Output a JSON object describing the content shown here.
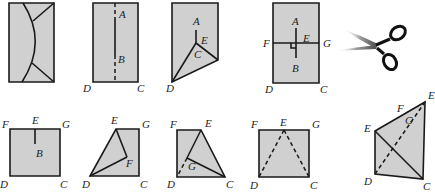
{
  "colors": {
    "paper": "#d0d0d0",
    "stroke": "#1a1a1a",
    "label": "#222222"
  },
  "panels": [
    {
      "id": "step1",
      "description": "Rectangle with curved cut and corner folds",
      "polygon": [
        [
          9,
          3
        ],
        [
          54,
          3
        ],
        [
          54,
          82
        ],
        [
          9,
          82
        ]
      ],
      "solid": [],
      "dashed": [],
      "curves": [
        "M23,3 Q48,42 22,82",
        "M54,3 L33,21",
        "M54,82 L32,63"
      ],
      "labels": []
    },
    {
      "id": "step2",
      "description": "Rectangle with vertical fold line AB",
      "polygon": [
        [
          93,
          3
        ],
        [
          138,
          3
        ],
        [
          138,
          82
        ],
        [
          93,
          82
        ]
      ],
      "solid": [
        [
          [
            115,
            17
          ],
          [
            115,
            55
          ]
        ]
      ],
      "dashed": [
        [
          [
            115,
            3
          ],
          [
            115,
            17
          ]
        ],
        [
          [
            115,
            55
          ],
          [
            115,
            82
          ]
        ]
      ],
      "curves": [],
      "labels": [
        {
          "t": "A",
          "x": 119,
          "y": 18
        },
        {
          "t": "B",
          "x": 118,
          "y": 63
        },
        {
          "t": "D",
          "x": 83,
          "y": 92
        },
        {
          "t": "C",
          "x": 137,
          "y": 92
        }
      ]
    },
    {
      "id": "step3",
      "description": "Folded shape with crease from C",
      "polygon": [
        [
          172,
          3
        ],
        [
          218,
          3
        ],
        [
          218,
          60
        ],
        [
          172,
          82
        ]
      ],
      "solid": [
        [
          [
            196,
            30
          ],
          [
            196,
            43
          ]
        ],
        [
          [
            196,
            43
          ],
          [
            172,
            82
          ]
        ],
        [
          [
            196,
            43
          ],
          [
            218,
            60
          ]
        ]
      ],
      "dashed": [],
      "curves": [],
      "labels": [
        {
          "t": "A",
          "x": 193,
          "y": 25
        },
        {
          "t": "E",
          "x": 201,
          "y": 44
        },
        {
          "t": "C",
          "x": 194,
          "y": 58
        },
        {
          "t": "D",
          "x": 166,
          "y": 92
        }
      ]
    },
    {
      "id": "step4",
      "description": "Rectangle with FG crease and AB perpendicular",
      "polygon": [
        [
          273,
          3
        ],
        [
          319,
          3
        ],
        [
          319,
          83
        ],
        [
          273,
          83
        ]
      ],
      "solid": [
        [
          [
            273,
            43
          ],
          [
            319,
            43
          ]
        ],
        [
          [
            296,
            28
          ],
          [
            296,
            58
          ]
        ]
      ],
      "dashed": [],
      "curves": [
        "M291,43 L291,48 L296,48"
      ],
      "labels": [
        {
          "t": "A",
          "x": 292,
          "y": 25
        },
        {
          "t": "F",
          "x": 263,
          "y": 47
        },
        {
          "t": "E",
          "x": 303,
          "y": 42
        },
        {
          "t": "G",
          "x": 323,
          "y": 47
        },
        {
          "t": "B",
          "x": 292,
          "y": 72
        },
        {
          "t": "D",
          "x": 265,
          "y": 93
        },
        {
          "t": "C",
          "x": 320,
          "y": 93
        }
      ]
    },
    {
      "id": "step5",
      "description": "Square FGCD with cut EB",
      "polygon": [
        [
          10,
          129
        ],
        [
          60,
          129
        ],
        [
          60,
          176
        ],
        [
          10,
          176
        ]
      ],
      "solid": [
        [
          [
            35,
            129
          ],
          [
            35,
            144
          ]
        ]
      ],
      "dashed": [],
      "curves": [],
      "labels": [
        {
          "t": "F",
          "x": 2,
          "y": 128
        },
        {
          "t": "E",
          "x": 32,
          "y": 124
        },
        {
          "t": "G",
          "x": 62,
          "y": 128
        },
        {
          "t": "B",
          "x": 36,
          "y": 157
        },
        {
          "t": "D",
          "x": 0,
          "y": 188
        },
        {
          "t": "C",
          "x": 60,
          "y": 188
        }
      ]
    },
    {
      "id": "step6",
      "description": "Fold E to F along DF",
      "polygon": [
        [
          116,
          129
        ],
        [
          139,
          129
        ],
        [
          139,
          176
        ],
        [
          90,
          176
        ]
      ],
      "solid": [
        [
          [
            116,
            129
          ],
          [
            127,
            157
          ]
        ],
        [
          [
            127,
            157
          ],
          [
            90,
            176
          ]
        ]
      ],
      "dashed": [],
      "curves": [],
      "labels": [
        {
          "t": "E",
          "x": 111,
          "y": 124
        },
        {
          "t": "G",
          "x": 142,
          "y": 128
        },
        {
          "t": "F",
          "x": 126,
          "y": 167
        },
        {
          "t": "D",
          "x": 82,
          "y": 188
        },
        {
          "t": "C",
          "x": 140,
          "y": 188
        }
      ]
    },
    {
      "id": "step7",
      "description": "Fold with G and crease EC",
      "polygon": [
        [
          177,
          130
        ],
        [
          201,
          130
        ],
        [
          225,
          177
        ],
        [
          177,
          177
        ]
      ],
      "solid": [
        [
          [
            201,
            130
          ],
          [
            187,
            158
          ]
        ],
        [
          [
            187,
            158
          ],
          [
            225,
            177
          ]
        ]
      ],
      "dashed": [
        [
          [
            187,
            158
          ],
          [
            177,
            177
          ]
        ]
      ],
      "curves": [],
      "labels": [
        {
          "t": "F",
          "x": 170,
          "y": 128
        },
        {
          "t": "E",
          "x": 205,
          "y": 127
        },
        {
          "t": "G",
          "x": 188,
          "y": 170
        },
        {
          "t": "D",
          "x": 167,
          "y": 188
        },
        {
          "t": "C",
          "x": 226,
          "y": 188
        }
      ]
    },
    {
      "id": "step8",
      "description": "Square with dashed lines ED and EC",
      "polygon": [
        [
          259,
          130
        ],
        [
          309,
          130
        ],
        [
          309,
          177
        ],
        [
          259,
          177
        ]
      ],
      "solid": [],
      "dashed": [
        [
          [
            284,
            130
          ],
          [
            259,
            177
          ]
        ],
        [
          [
            284,
            130
          ],
          [
            309,
            177
          ]
        ]
      ],
      "curves": [],
      "labels": [
        {
          "t": "F",
          "x": 251,
          "y": 128
        },
        {
          "t": "E",
          "x": 280,
          "y": 126
        },
        {
          "t": "G",
          "x": 312,
          "y": 128
        },
        {
          "t": "D",
          "x": 250,
          "y": 189
        },
        {
          "t": "C",
          "x": 310,
          "y": 189
        }
      ]
    },
    {
      "id": "step9",
      "description": "Final folded quadrilateral",
      "polygon": [
        [
          375,
          131
        ],
        [
          425,
          102
        ],
        [
          423,
          179
        ],
        [
          375,
          174
        ]
      ],
      "solid": [
        [
          [
            375,
            131
          ],
          [
            423,
            179
          ]
        ]
      ],
      "dashed": [
        [
          [
            375,
            174
          ],
          [
            425,
            102
          ]
        ]
      ],
      "curves": [],
      "labels": [
        {
          "t": "E",
          "x": 428,
          "y": 99
        },
        {
          "t": "F",
          "x": 397,
          "y": 112
        },
        {
          "t": "G",
          "x": 405,
          "y": 124
        },
        {
          "t": "E",
          "x": 364,
          "y": 132
        },
        {
          "t": "D",
          "x": 364,
          "y": 185
        },
        {
          "t": "C",
          "x": 423,
          "y": 190
        }
      ]
    }
  ],
  "scissors": {
    "icon": "scissors-icon",
    "pivot": [
      375,
      46
    ],
    "blade_upper_tip": [
      343,
      29
    ],
    "blade_lower_tip": [
      336,
      51
    ],
    "ring_upper": [
      397,
      34
    ],
    "ring_lower": [
      389,
      61
    ]
  }
}
